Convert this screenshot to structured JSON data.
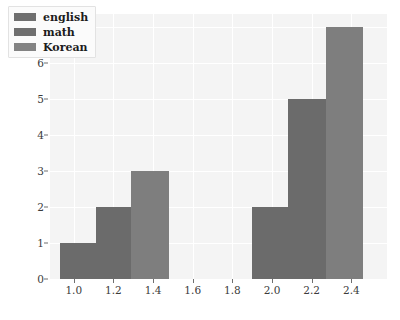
{
  "chart_data": {
    "type": "bar",
    "title": "",
    "xlabel": "",
    "ylabel": "",
    "xlim": [
      0.88,
      2.58
    ],
    "ylim": [
      0,
      7.35
    ],
    "grid": true,
    "legend_position": "upper left",
    "xticks": [
      "1.0",
      "1.2",
      "1.4",
      "1.6",
      "1.8",
      "2.0",
      "2.2",
      "2.4"
    ],
    "xtick_values": [
      1.0,
      1.2,
      1.4,
      1.6,
      1.8,
      2.0,
      2.2,
      2.4
    ],
    "yticks": [
      "0",
      "1",
      "2",
      "3",
      "4",
      "5",
      "6",
      "7"
    ],
    "ytick_values": [
      0,
      1,
      2,
      3,
      4,
      5,
      6,
      7
    ],
    "legend": [
      {
        "label": "english",
        "color": "#6f6f6f"
      },
      {
        "label": "math",
        "color": "#6f6f6f"
      },
      {
        "label": "Korean",
        "color": "#838383"
      }
    ],
    "bars": [
      {
        "x_left": 0.93,
        "x_right": 1.11,
        "value": 1,
        "color": "#6b6b6b"
      },
      {
        "x_left": 1.11,
        "x_right": 1.29,
        "value": 2,
        "color": "#6b6b6b"
      },
      {
        "x_left": 1.29,
        "x_right": 1.48,
        "value": 3,
        "color": "#7e7e7e"
      },
      {
        "x_left": 1.9,
        "x_right": 2.08,
        "value": 2,
        "color": "#6b6b6b"
      },
      {
        "x_left": 2.08,
        "x_right": 2.27,
        "value": 5,
        "color": "#6b6b6b"
      },
      {
        "x_left": 2.27,
        "x_right": 2.46,
        "value": 7,
        "color": "#7e7e7e"
      }
    ],
    "categories": [
      "1.0",
      "1.2",
      "1.4",
      "2.0",
      "2.2",
      "2.4"
    ],
    "values": [
      1,
      2,
      3,
      2,
      5,
      7
    ]
  },
  "style": {
    "figure_background": "#ffffff",
    "axes_background": "#f4f4f4",
    "gridline_color": "#ffffff",
    "tick_label_color": "#3b3b3b"
  }
}
